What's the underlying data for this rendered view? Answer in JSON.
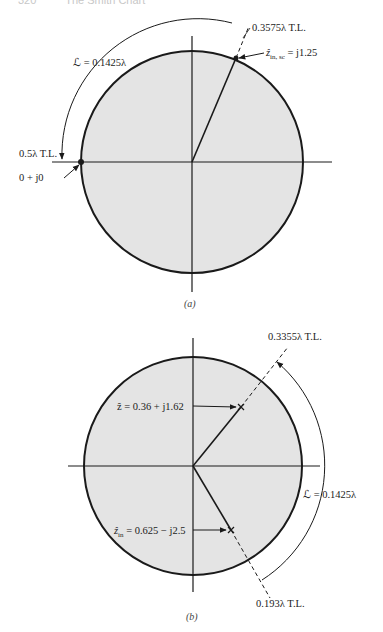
{
  "header": {
    "page_number": "320",
    "running_title": "The Smith Chart"
  },
  "figures": [
    {
      "id": "a",
      "caption": "(a)",
      "labels": {
        "tl_top": "0.3575λ T.L.",
        "zin_sc_prefix": "ẑ",
        "zin_sc_sub": "in, sc",
        "zin_sc_value": " = j1.25",
        "length": "ℒ = 0.1425λ",
        "tl_left": "0.5λ T.L.",
        "origin_point": "0 + j0"
      }
    },
    {
      "id": "b",
      "caption": "(b)",
      "labels": {
        "tl_top": "0.3355λ T.L.",
        "z_load": "ẑ = 0.36 + j1.62",
        "length": "ℒ = 0.1425λ",
        "zin_prefix": "ẑ",
        "zin_sub": "in",
        "zin_value": " = 0.625 − j2.5",
        "tl_bottom": "0.193λ T.L."
      }
    }
  ],
  "colors": {
    "chart_fill": "#e4e4e4",
    "stroke": "#1a1a1a"
  }
}
